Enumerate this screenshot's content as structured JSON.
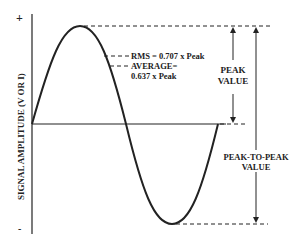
{
  "diagram": {
    "y_axis": {
      "label": "SIGNAL AMPLITUDE (V OR I)",
      "plus_label": "+",
      "minus_label": "-"
    },
    "annotations": {
      "rms": "RMS = 0.707 x Peak",
      "average_line1": "AVERAGE=",
      "average_line2": "0.637 x Peak",
      "peak_line1": "PEAK",
      "peak_line2": "VALUE",
      "p2p_line1": "PEAK-TO-PEAK",
      "p2p_line2": "VALUE"
    },
    "colors": {
      "stroke": "#222222",
      "background": "#ffffff"
    }
  }
}
